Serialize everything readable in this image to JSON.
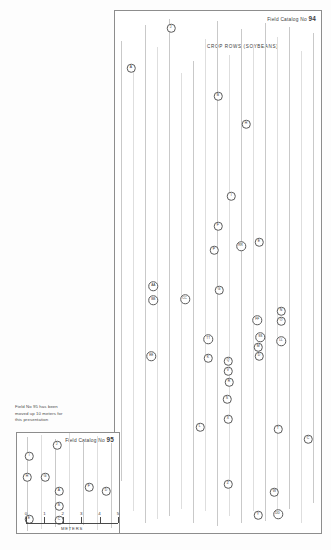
{
  "document": {
    "type": "archaeological-field-map",
    "description": "Plan map of artifact find locations across soybean crop rows"
  },
  "main_map": {
    "catalog_prefix": "Field Catalog No",
    "catalog_number": "94",
    "crop_rows_label": "CROP  ROWS  (SOYBEANS)",
    "markers": [
      {
        "label": "J",
        "x": 56,
        "y": 17,
        "size": "m1"
      },
      {
        "label": "A",
        "x": 16,
        "y": 57,
        "size": "m1"
      },
      {
        "label": "B",
        "x": 103,
        "y": 85,
        "size": "m1"
      },
      {
        "label": "H",
        "x": 131,
        "y": 113,
        "size": "m1"
      },
      {
        "label": "U",
        "x": -6,
        "y": 132,
        "size": "m1"
      },
      {
        "label": "I",
        "x": 116,
        "y": 185,
        "size": "m1"
      },
      {
        "label": "F",
        "x": 103,
        "y": 215,
        "size": "m1"
      },
      {
        "label": "P",
        "x": 99,
        "y": 239,
        "size": "m1"
      },
      {
        "label": "RR",
        "x": 126,
        "y": 235,
        "size": "m2"
      },
      {
        "label": "E",
        "x": 144,
        "y": 231,
        "size": "m1"
      },
      {
        "label": "AA",
        "x": 38,
        "y": 275,
        "size": "m2"
      },
      {
        "label": "BB",
        "x": 38,
        "y": 289,
        "size": "m2"
      },
      {
        "label": "CC",
        "x": 70,
        "y": 288,
        "size": "m2"
      },
      {
        "label": "G",
        "x": 104,
        "y": 279,
        "size": "m1"
      },
      {
        "label": "N",
        "x": 166,
        "y": 300,
        "size": "m1"
      },
      {
        "label": "O",
        "x": 166,
        "y": 310,
        "size": "m1"
      },
      {
        "label": "FF",
        "x": 142,
        "y": 309,
        "size": "m2"
      },
      {
        "label": "LL",
        "x": 166,
        "y": 330,
        "size": "m2"
      },
      {
        "label": "SS",
        "x": 145,
        "y": 326,
        "size": "m2"
      },
      {
        "label": "M",
        "x": 143,
        "y": 336,
        "size": "m1"
      },
      {
        "label": "D",
        "x": 144,
        "y": 345,
        "size": "m1"
      },
      {
        "label": "TT",
        "x": 93,
        "y": 328,
        "size": "m2"
      },
      {
        "label": "EE",
        "x": 36,
        "y": 345,
        "size": "m2"
      },
      {
        "label": "K",
        "x": 93,
        "y": 347,
        "size": "m1"
      },
      {
        "label": "Q",
        "x": 113,
        "y": 350,
        "size": "m1"
      },
      {
        "label": "V",
        "x": 113,
        "y": 360,
        "size": "m1"
      },
      {
        "label": "R",
        "x": 114,
        "y": 371,
        "size": "m1"
      },
      {
        "label": "S",
        "x": 112,
        "y": 388,
        "size": "m1"
      },
      {
        "label": "X",
        "x": 113,
        "y": 408,
        "size": "m1"
      },
      {
        "label": "L",
        "x": 85,
        "y": 416,
        "size": "m1"
      },
      {
        "label": "T",
        "x": 163,
        "y": 418,
        "size": "m1"
      },
      {
        "label": "C",
        "x": 193,
        "y": 428,
        "size": "m1"
      },
      {
        "label": "Z",
        "x": 113,
        "y": 473,
        "size": "m1"
      },
      {
        "label": "W",
        "x": 159,
        "y": 481,
        "size": "m1"
      },
      {
        "label": "Y",
        "x": 143,
        "y": 504,
        "size": "m1"
      },
      {
        "label": "DD",
        "x": 163,
        "y": 503,
        "size": "m2"
      }
    ]
  },
  "inset_map": {
    "note": "Field No 95 has been\nmoved up 10 meters for\nthis presentation",
    "catalog_prefix": "Field Catalog No",
    "catalog_number": "95",
    "markers": [
      {
        "label": "J",
        "x": 40,
        "y": 12,
        "size": "m1"
      },
      {
        "label": "I",
        "x": 12,
        "y": 23,
        "size": "m1"
      },
      {
        "label": "H",
        "x": 10,
        "y": 44,
        "size": "m1"
      },
      {
        "label": "G",
        "x": 28,
        "y": 44,
        "size": "m1"
      },
      {
        "label": "A",
        "x": 42,
        "y": 58,
        "size": "m1"
      },
      {
        "label": "F",
        "x": 72,
        "y": 54,
        "size": "m1"
      },
      {
        "label": "D",
        "x": 89,
        "y": 58,
        "size": "m1"
      },
      {
        "label": "B",
        "x": 42,
        "y": 73,
        "size": "m1"
      },
      {
        "label": "C",
        "x": 42,
        "y": 87,
        "size": "m1"
      },
      {
        "label": "E",
        "x": 12,
        "y": 86,
        "size": "m1"
      }
    ]
  },
  "scale": {
    "caption": "METERS",
    "ticks": [
      "0",
      "1",
      "2",
      "3",
      "4",
      "5"
    ]
  }
}
